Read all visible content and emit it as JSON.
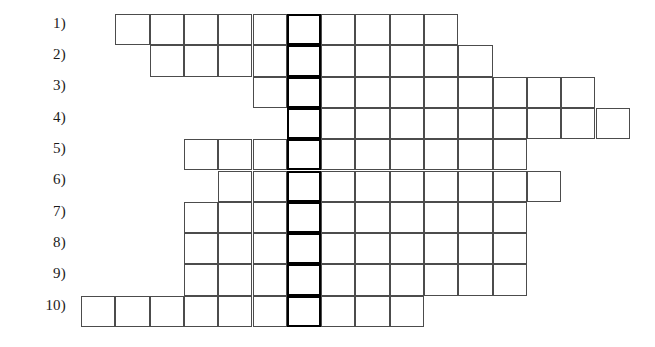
{
  "puzzle": {
    "type": "crossword-skeleton-grid",
    "kind": "acrostic-word-ladder",
    "rows_total": 10,
    "cells_per_row": 10,
    "highlighted_column_index": 6,
    "highlighted_column_note": "bold vertical keyword column",
    "cell_width": 34.3,
    "cell_height": 31.3,
    "grid_origin_x": 81,
    "grid_origin_y": 14,
    "colors": {
      "page_background": "#ffffff",
      "cell_fill": "#ffffff",
      "cell_border": "#4c4c4c",
      "highlight_border": "#000000",
      "label_text": "#1a1a1a"
    },
    "label_x_right": 66,
    "rows": [
      {
        "number": 1,
        "label": "1)",
        "start_col": 1,
        "cells": 10,
        "label_y": 16
      },
      {
        "number": 2,
        "label": "2)",
        "start_col": 2,
        "cells": 10,
        "label_y": 47
      },
      {
        "number": 3,
        "label": "3)",
        "start_col": 5,
        "cells": 10,
        "label_y": 78
      },
      {
        "number": 4,
        "label": "4)",
        "start_col": 6,
        "cells": 10,
        "label_y": 110
      },
      {
        "number": 5,
        "label": "5)",
        "start_col": 3,
        "cells": 10,
        "label_y": 141
      },
      {
        "number": 6,
        "label": "6)",
        "start_col": 4,
        "cells": 10,
        "label_y": 172
      },
      {
        "number": 7,
        "label": "7)",
        "start_col": 3,
        "cells": 10,
        "label_y": 204
      },
      {
        "number": 8,
        "label": "8)",
        "start_col": 3,
        "cells": 10,
        "label_y": 235
      },
      {
        "number": 9,
        "label": "9)",
        "start_col": 3,
        "cells": 10,
        "label_y": 266
      },
      {
        "number": 10,
        "label": "10)",
        "start_col": 0,
        "cells": 10,
        "label_y": 298
      }
    ]
  }
}
